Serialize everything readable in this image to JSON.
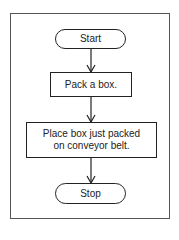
{
  "diagram": {
    "type": "flowchart",
    "nodes": [
      {
        "id": "start",
        "shape": "terminal",
        "label": "Start"
      },
      {
        "id": "pack",
        "shape": "process",
        "label": "Pack a box."
      },
      {
        "id": "place",
        "shape": "process",
        "label_line1": "Place box just packed",
        "label_line2": "on conveyor belt."
      },
      {
        "id": "stop",
        "shape": "terminal",
        "label": "Stop"
      }
    ],
    "edges": [
      {
        "from": "start",
        "to": "pack"
      },
      {
        "from": "pack",
        "to": "place"
      },
      {
        "from": "place",
        "to": "stop"
      }
    ]
  }
}
